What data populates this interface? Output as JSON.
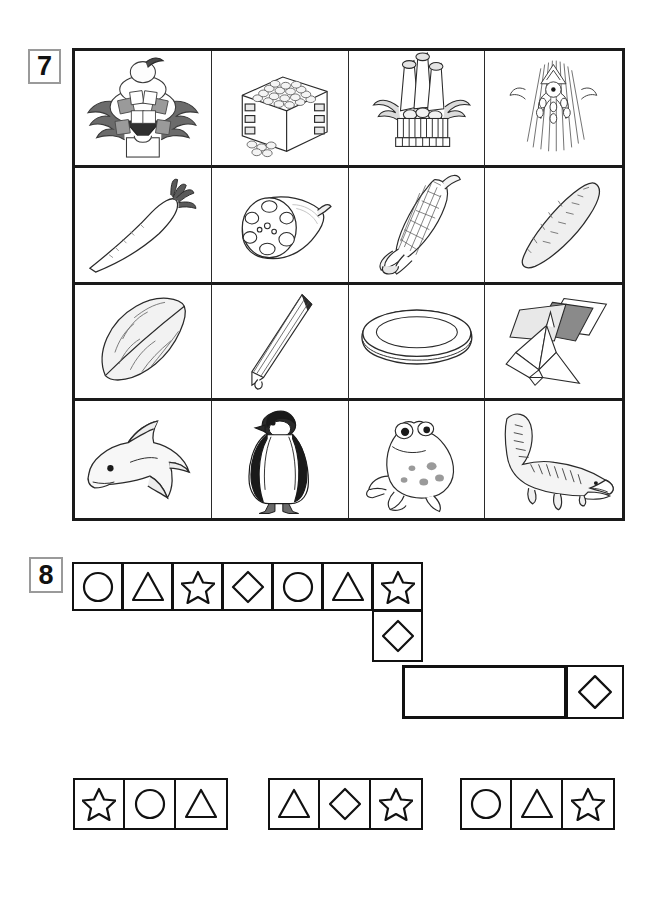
{
  "worksheet": {
    "problems": [
      {
        "number": "7",
        "type": "picture-grid"
      },
      {
        "number": "8",
        "type": "shape-pattern"
      }
    ]
  },
  "problem7": {
    "number": "7",
    "rows": 4,
    "columns": 4,
    "cells": [
      {
        "row": 1,
        "col": 1,
        "name": "kagami-mochi",
        "label": "kagami mochi new year decoration"
      },
      {
        "row": 1,
        "col": 2,
        "name": "masu-box-beans",
        "label": "wooden masu box with beans"
      },
      {
        "row": 1,
        "col": 3,
        "name": "kadomatsu",
        "label": "kadomatsu pine decoration"
      },
      {
        "row": 1,
        "col": 4,
        "name": "shimekazari",
        "label": "shimekazari straw decoration"
      },
      {
        "row": 2,
        "col": 1,
        "name": "daikon-radish",
        "label": "daikon radish"
      },
      {
        "row": 2,
        "col": 2,
        "name": "lotus-root",
        "label": "lotus root"
      },
      {
        "row": 2,
        "col": 3,
        "name": "corn-cob",
        "label": "corn on the cob"
      },
      {
        "row": 2,
        "col": 4,
        "name": "sweet-potato",
        "label": "sweet potato"
      },
      {
        "row": 3,
        "col": 1,
        "name": "leaf",
        "label": "leaf"
      },
      {
        "row": 3,
        "col": 2,
        "name": "pencil",
        "label": "pencil"
      },
      {
        "row": 3,
        "col": 3,
        "name": "plate",
        "label": "plate"
      },
      {
        "row": 3,
        "col": 4,
        "name": "origami-crane",
        "label": "origami crane and paper"
      },
      {
        "row": 4,
        "col": 1,
        "name": "dolphin",
        "label": "dolphin"
      },
      {
        "row": 4,
        "col": 2,
        "name": "penguin",
        "label": "penguin"
      },
      {
        "row": 4,
        "col": 3,
        "name": "frog",
        "label": "frog"
      },
      {
        "row": 4,
        "col": 4,
        "name": "crocodile",
        "label": "crocodile"
      }
    ]
  },
  "problem8": {
    "number": "8",
    "pattern_row": [
      "circle",
      "triangle",
      "star",
      "diamond",
      "circle",
      "triangle",
      "star"
    ],
    "pattern_column": [
      "diamond"
    ],
    "blank_answer_cells": 1,
    "pattern_tail": [
      "diamond"
    ],
    "options": [
      {
        "index": 1,
        "shapes": [
          "star",
          "circle",
          "triangle"
        ]
      },
      {
        "index": 2,
        "shapes": [
          "triangle",
          "diamond",
          "star"
        ]
      },
      {
        "index": 3,
        "shapes": [
          "circle",
          "triangle",
          "star"
        ]
      }
    ]
  },
  "colors": {
    "ink": "#111111",
    "grid_line": "#2a2a2a",
    "badge_border": "#9a9a9a",
    "paper": "#ffffff"
  }
}
